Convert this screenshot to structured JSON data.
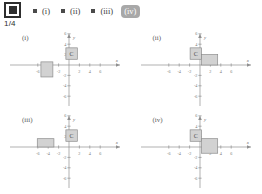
{
  "toolbar": {
    "slide_icon": "slide-frame-icon",
    "slide_counter": "1/4"
  },
  "options": [
    {
      "label": "(i)",
      "selected": false,
      "bullet": "square-bullet"
    },
    {
      "label": "(ii)",
      "selected": false,
      "bullet": "square-bullet"
    },
    {
      "label": "(iii)",
      "selected": false,
      "bullet": "square-bullet"
    },
    {
      "label": "(iv)",
      "selected": true,
      "bullet": "square-bullet"
    }
  ],
  "plots": [
    {
      "tag": "(i)",
      "xlabel": "x",
      "ylabel": "y",
      "xticks": [
        "-6",
        "-4",
        "-2",
        "2",
        "4",
        "6"
      ],
      "yticks": [
        "6",
        "4",
        "2",
        "-2",
        "-4",
        "-6"
      ],
      "shapes": [
        {
          "name": "square-c",
          "label": "C",
          "x0": -0.6,
          "y0": 1.1,
          "x1": 1.6,
          "y1": 3.3
        },
        {
          "name": "rectangle",
          "label": "",
          "x0": -5.4,
          "y0": -2.3,
          "x1": -3.1,
          "y1": 0.6
        }
      ]
    },
    {
      "tag": "(ii)",
      "xlabel": "x",
      "ylabel": "y",
      "xticks": [
        "-6",
        "-4",
        "-2",
        "2",
        "4",
        "6"
      ],
      "yticks": [
        "6",
        "4",
        "2",
        "-2",
        "-4",
        "-6"
      ],
      "shapes": [
        {
          "name": "square-c",
          "label": "C",
          "x0": -1.9,
          "y0": 1.1,
          "x1": 0.3,
          "y1": 3.3
        },
        {
          "name": "rectangle",
          "label": "",
          "x0": 0.3,
          "y0": 0.0,
          "x1": 3.4,
          "y1": 2.0
        }
      ]
    },
    {
      "tag": "(iii)",
      "xlabel": "x",
      "ylabel": "y",
      "xticks": [
        "-6",
        "-4",
        "-2",
        "2",
        "4",
        "6"
      ],
      "yticks": [
        "6",
        "4",
        "2",
        "-2",
        "-4",
        "-6"
      ],
      "shapes": [
        {
          "name": "square-c",
          "label": "C",
          "x0": -0.6,
          "y0": 1.1,
          "x1": 1.6,
          "y1": 3.3
        },
        {
          "name": "rectangle",
          "label": "",
          "x0": -6.1,
          "y0": 0.0,
          "x1": -2.9,
          "y1": 1.6
        }
      ]
    },
    {
      "tag": "(iv)",
      "xlabel": "x",
      "ylabel": "y",
      "xticks": [
        "-6",
        "-4",
        "-2",
        "2",
        "4",
        "6"
      ],
      "yticks": [
        "6",
        "4",
        "2",
        "-2",
        "-4",
        "-6"
      ],
      "shapes": [
        {
          "name": "square-c",
          "label": "C",
          "x0": -1.9,
          "y0": 1.1,
          "x1": 0.3,
          "y1": 3.3
        },
        {
          "name": "rectangle",
          "label": "",
          "x0": 0.3,
          "y0": -1.2,
          "x1": 3.4,
          "y1": 1.6
        }
      ]
    }
  ],
  "style": {
    "shape_fill": "#d2d2d2",
    "shape_stroke": "#8c8c8c",
    "axis_color": "#8f8f8f",
    "selected_bg": "#a8a8a8"
  }
}
